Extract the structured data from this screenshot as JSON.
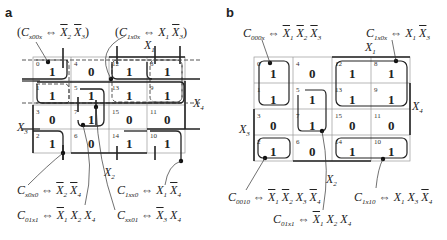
{
  "panels": [
    {
      "id": "a",
      "label": "a",
      "annotations": {
        "top_left": "(C_x00x ⇔ X̄2 X̄3)",
        "top_right": "(C_1x0x ⇔ X1 X̄3)",
        "bottom": [
          "C_x0x0 ⇔ X̄2 X̄4",
          "C_1xx0 ⇔ X1 X̄4",
          "C_01x1 ⇔ X̄1 X2 X4",
          "C_xx01 ⇔ X̄3 X4"
        ]
      },
      "axis_labels": {
        "x1": "X1",
        "x2": "X2",
        "x3": "X3",
        "x4": "X4"
      },
      "cells": [
        [
          {
            "idx": "0",
            "val": "1"
          },
          {
            "idx": "4",
            "val": "0"
          },
          {
            "idx": "12",
            "val": "1"
          },
          {
            "idx": "8",
            "val": "1"
          }
        ],
        [
          {
            "idx": "1",
            "val": "1"
          },
          {
            "idx": "5",
            "val": "1"
          },
          {
            "idx": "13",
            "val": "1"
          },
          {
            "idx": "9",
            "val": "1"
          }
        ],
        [
          {
            "idx": "3",
            "val": "0"
          },
          {
            "idx": "7",
            "val": "1"
          },
          {
            "idx": "15",
            "val": "0"
          },
          {
            "idx": "11",
            "val": "0"
          }
        ],
        [
          {
            "idx": "2",
            "val": "1"
          },
          {
            "idx": "6",
            "val": "0"
          },
          {
            "idx": "14",
            "val": "1"
          },
          {
            "idx": "10",
            "val": "1"
          }
        ]
      ]
    },
    {
      "id": "b",
      "label": "b",
      "annotations": {
        "top_left": "C_000x ⇔ X̄1 X̄2 X̄3",
        "top_right": "C_1x0x ⇔ X1 X̄3",
        "bottom": [
          "C_0010 ⇔ X̄1 X̄2 X3 X̄4",
          "C_1x10 ⇔ X1 X3 X̄4",
          "C_01x1 ⇔ X̄1 X2 X4"
        ]
      },
      "axis_labels": {
        "x1": "X1",
        "x2": "X2",
        "x3": "X3",
        "x4": "X4"
      },
      "cells": [
        [
          {
            "idx": "0",
            "val": "1"
          },
          {
            "idx": "4",
            "val": "0"
          },
          {
            "idx": "12",
            "val": "1"
          },
          {
            "idx": "8",
            "val": "1"
          }
        ],
        [
          {
            "idx": "1",
            "val": "1"
          },
          {
            "idx": "5",
            "val": "1"
          },
          {
            "idx": "13",
            "val": "1"
          },
          {
            "idx": "9",
            "val": "1"
          }
        ],
        [
          {
            "idx": "3",
            "val": "0"
          },
          {
            "idx": "7",
            "val": "1"
          },
          {
            "idx": "15",
            "val": "0"
          },
          {
            "idx": "11",
            "val": "0"
          }
        ],
        [
          {
            "idx": "2",
            "val": "1"
          },
          {
            "idx": "6",
            "val": "0"
          },
          {
            "idx": "14",
            "val": "1"
          },
          {
            "idx": "10",
            "val": "1"
          }
        ]
      ]
    }
  ]
}
